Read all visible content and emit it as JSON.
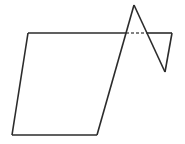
{
  "figure": {
    "title": "",
    "type": "line-drawing",
    "background_color": "#ffffff",
    "stroke_color": "#2b2b2b",
    "dashed_stroke_color": "#5a5a5a",
    "stroke_width": 1.6,
    "dash_pattern": "3,2",
    "width": 185,
    "height": 144,
    "vertices": {
      "top_left": [
        28,
        33
      ],
      "bottom_left": [
        12,
        135
      ],
      "bottom_right": [
        97,
        135
      ],
      "top_line_right_end": [
        172,
        33
      ],
      "peak_apex": [
        134,
        5
      ],
      "diagonal_top_crossing": [
        125,
        33
      ],
      "valley_bottom": [
        165,
        72
      ],
      "dash_start": [
        126,
        33
      ],
      "dash_end": [
        147,
        33
      ]
    },
    "segments": [
      {
        "name": "top-edge-solid-left",
        "style": "solid",
        "points": "28,33 126,33"
      },
      {
        "name": "top-edge-dashed-middle",
        "style": "dashed",
        "points": "126,33 147,33"
      },
      {
        "name": "top-edge-solid-right",
        "style": "solid",
        "points": "147,33 172,33"
      },
      {
        "name": "left-side",
        "style": "solid",
        "points": "28,33 12,135"
      },
      {
        "name": "bottom-edge",
        "style": "solid",
        "points": "12,135 97,135"
      },
      {
        "name": "long-diagonal-to-apex",
        "style": "solid",
        "points": "97,135 134,5"
      },
      {
        "name": "apex-down-to-valley",
        "style": "solid",
        "points": "134,5 165,72"
      },
      {
        "name": "valley-up-to-right-corner",
        "style": "solid",
        "points": "165,72 172,33"
      }
    ]
  }
}
